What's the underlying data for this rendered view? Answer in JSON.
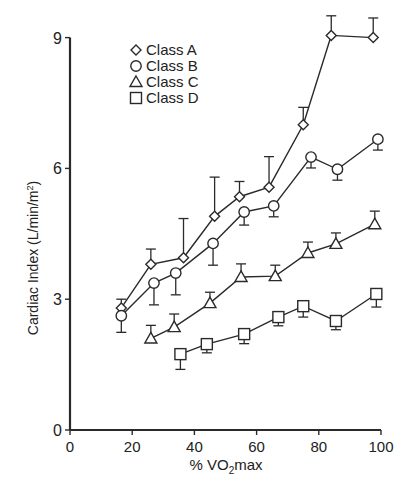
{
  "chart_data": {
    "type": "line",
    "title": "",
    "xlabel": "% V̇O2max",
    "xlabel_parts": {
      "prefix": "% ",
      "v": "V",
      "o": "O",
      "sub": "2",
      "suffix": "max"
    },
    "ylabel": "Cardiac Index (L/min/m²)",
    "ylabel_parts": {
      "main": "Cardiac Index (L/min/m",
      "sup": "2",
      "end": ")"
    },
    "xlim": [
      0,
      100
    ],
    "ylim": [
      0,
      9
    ],
    "xticks": [
      0,
      20,
      40,
      60,
      80,
      100
    ],
    "yticks": [
      0,
      3,
      6,
      9
    ],
    "grid": false,
    "legend_position": "upper-left",
    "series": [
      {
        "name": "Class A",
        "marker": "diamond",
        "x": [
          16.5,
          26,
          36.5,
          46.5,
          54.5,
          64,
          75,
          84,
          97.5
        ],
        "y": [
          2.8,
          3.8,
          3.95,
          4.9,
          5.35,
          5.57,
          7.0,
          9.05,
          9.0
        ],
        "err_up": [
          0.2,
          0.35,
          0.9,
          0.9,
          0.35,
          0.7,
          0.4,
          0.45,
          0.45
        ],
        "err_down": [
          0,
          0,
          0,
          0,
          0,
          0,
          0,
          0,
          0
        ]
      },
      {
        "name": "Class B",
        "marker": "circle",
        "x": [
          16.5,
          27,
          34,
          46,
          56,
          65.5,
          77.5,
          86,
          99
        ],
        "y": [
          2.62,
          3.37,
          3.6,
          4.28,
          5.0,
          5.14,
          6.26,
          5.98,
          6.67
        ],
        "err_up": [
          0,
          0,
          0,
          0,
          0,
          0,
          0,
          0,
          0
        ],
        "err_down": [
          0.38,
          0.5,
          0.5,
          0.5,
          0.3,
          0.25,
          0.25,
          0.25,
          0.25
        ]
      },
      {
        "name": "Class C",
        "marker": "triangle",
        "x": [
          26,
          33.5,
          45,
          55,
          66,
          76.5,
          85.5,
          98
        ],
        "y": [
          2.1,
          2.36,
          2.91,
          3.51,
          3.53,
          4.06,
          4.27,
          4.72
        ],
        "err_up": [
          0.3,
          0.3,
          0.25,
          0.3,
          0.25,
          0.25,
          0.25,
          0.3
        ],
        "err_down": [
          0,
          0,
          0,
          0,
          0,
          0,
          0,
          0
        ]
      },
      {
        "name": "Class D",
        "marker": "square",
        "x": [
          35.5,
          44,
          56,
          67,
          75,
          85.5,
          98.5
        ],
        "y": [
          1.74,
          1.97,
          2.2,
          2.59,
          2.84,
          2.5,
          3.12
        ],
        "err_up": [
          0,
          0,
          0,
          0,
          0,
          0,
          0
        ],
        "err_down": [
          0.35,
          0.2,
          0.22,
          0.2,
          0.25,
          0.2,
          0.3
        ]
      }
    ]
  }
}
